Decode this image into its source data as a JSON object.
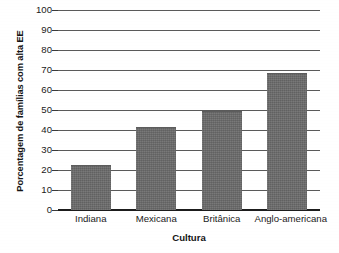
{
  "chart_data": {
    "type": "bar",
    "title": "",
    "categories": [
      "Indiana",
      "Mexicana",
      "Britânica",
      "Anglo-americana"
    ],
    "values": [
      22,
      41,
      49,
      68
    ],
    "xlabel": "Cultura",
    "ylabel": "Porcentagem de famílias com alta EE",
    "ylim": [
      0,
      100
    ],
    "ytick_labels": [
      "0",
      "10",
      "20",
      "30",
      "40",
      "50",
      "60",
      "70",
      "80",
      "90",
      "100"
    ],
    "ytick_values": [
      0,
      10,
      20,
      30,
      40,
      50,
      60,
      70,
      80,
      90,
      100
    ],
    "grid": "horizontal",
    "legend": "none",
    "bar_color": "#6b6b6b",
    "axis_color": "#1c1c1c",
    "gridline_color": "#5a5a5a",
    "background_color": "#ffffff"
  }
}
